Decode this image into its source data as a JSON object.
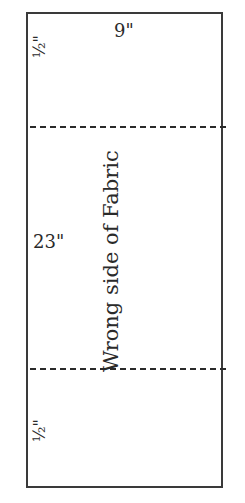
{
  "diagram": {
    "labels": {
      "width": "9\"",
      "height": "23\"",
      "top_seam": "½\"",
      "bottom_seam": "½\"",
      "center_text": "Wrong side of Fabric"
    },
    "fold_lines": [
      {
        "name": "top-fold",
        "style": "dashed"
      },
      {
        "name": "bottom-fold",
        "style": "dashed"
      }
    ],
    "colors": {
      "outline": "#3a3a3a",
      "background": "#ffffff",
      "text": "#2a2a2a"
    }
  }
}
